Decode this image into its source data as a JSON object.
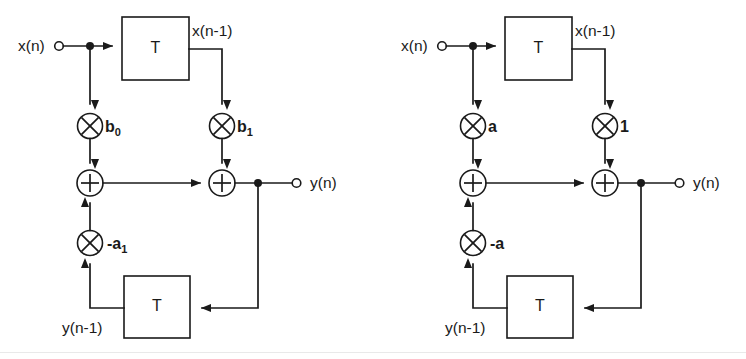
{
  "figure": {
    "type": "signal-flow-block-diagram",
    "background_color": "#ffffff",
    "line_color": "#1a1a1a",
    "width": 746,
    "height": 359
  },
  "diagrams": [
    {
      "id": "left",
      "name": "general-first-order-filter",
      "input_label": "x(n)",
      "delayed_input_label": "x(n-1)",
      "output_label": "y(n)",
      "delayed_output_label": "y(n-1)",
      "delay_block_top_label": "T",
      "delay_block_bottom_label": "T",
      "multiplier_symbol": "✕",
      "adder_symbol": "+",
      "coefficients": {
        "feedforward_direct": "b0",
        "feedforward_direct_base": "b",
        "feedforward_direct_sub": "0",
        "feedforward_delayed": "b1",
        "feedforward_delayed_base": "b",
        "feedforward_delayed_sub": "1",
        "feedback": "-a1",
        "feedback_base": "-a",
        "feedback_sub": "1"
      }
    },
    {
      "id": "right",
      "name": "specific-first-order-filter",
      "input_label": "x(n)",
      "delayed_input_label": "x(n-1)",
      "output_label": "y(n)",
      "delayed_output_label": "y(n-1)",
      "delay_block_top_label": "T",
      "delay_block_bottom_label": "T",
      "multiplier_symbol": "✕",
      "adder_symbol": "+",
      "coefficients": {
        "feedforward_direct": "a",
        "feedforward_direct_base": "a",
        "feedforward_direct_sub": "",
        "feedforward_delayed": "1",
        "feedforward_delayed_base": "1",
        "feedforward_delayed_sub": "",
        "feedback": "-a",
        "feedback_base": "-a",
        "feedback_sub": ""
      }
    }
  ]
}
